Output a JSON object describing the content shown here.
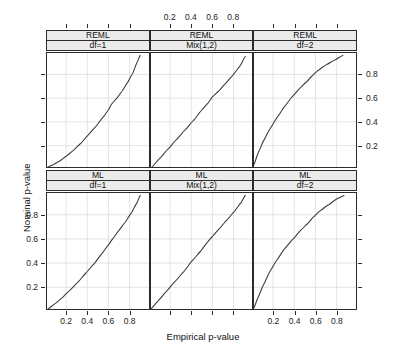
{
  "figure": {
    "type": "trellis-qq-grid",
    "xlabel": "Empirical p-value",
    "ylabel": "Nominal p-value",
    "axis_ticks": [
      "0.2",
      "0.4",
      "0.6",
      "0.8"
    ],
    "tick_values": [
      0.2,
      0.4,
      0.6,
      0.8
    ],
    "xlim": [
      0.02,
      0.98
    ],
    "ylim": [
      0.02,
      0.98
    ],
    "rows": [
      "REML",
      "ML"
    ],
    "columns": [
      "df=1",
      "Mix(1,2)",
      "df=2"
    ],
    "strip_bg": "#ebebeb",
    "curve_color": "#3a3a3a",
    "grid_color": "#d9d9d9"
  },
  "chart_data": {
    "type": "line",
    "title": "",
    "xlabel": "Empirical p-value",
    "ylabel": "Nominal p-value",
    "xlim": [
      0.02,
      0.98
    ],
    "ylim": [
      0.02,
      0.98
    ],
    "xticks": [
      0.2,
      0.4,
      0.6,
      0.8
    ],
    "yticks": [
      0.2,
      0.4,
      0.6,
      0.8
    ],
    "grid": true,
    "legend": "none",
    "panels": [
      {
        "row_strip": "REML",
        "col_strip": "df=1",
        "row": 0,
        "col": 0,
        "x": [
          0.03,
          0.08,
          0.14,
          0.2,
          0.27,
          0.34,
          0.41,
          0.48,
          0.55,
          0.6,
          0.63,
          0.68,
          0.73,
          0.78,
          0.83,
          0.87,
          0.9
        ],
        "y": [
          0.02,
          0.04,
          0.07,
          0.11,
          0.16,
          0.22,
          0.29,
          0.36,
          0.44,
          0.5,
          0.55,
          0.6,
          0.66,
          0.73,
          0.81,
          0.9,
          0.96
        ]
      },
      {
        "row_strip": "REML",
        "col_strip": "Mix(1,2)",
        "row": 0,
        "col": 1,
        "x": [
          0.03,
          0.1,
          0.18,
          0.26,
          0.34,
          0.42,
          0.5,
          0.56,
          0.6,
          0.66,
          0.72,
          0.79,
          0.86,
          0.91
        ],
        "y": [
          0.02,
          0.09,
          0.17,
          0.25,
          0.33,
          0.41,
          0.5,
          0.56,
          0.61,
          0.66,
          0.72,
          0.79,
          0.87,
          0.95
        ]
      },
      {
        "row_strip": "REML",
        "col_strip": "df=2",
        "row": 0,
        "col": 2,
        "x": [
          0.02,
          0.06,
          0.11,
          0.17,
          0.24,
          0.31,
          0.38,
          0.45,
          0.52,
          0.56,
          0.62,
          0.7,
          0.78,
          0.86
        ],
        "y": [
          0.04,
          0.14,
          0.24,
          0.34,
          0.44,
          0.53,
          0.61,
          0.68,
          0.74,
          0.78,
          0.83,
          0.88,
          0.92,
          0.96
        ]
      },
      {
        "row_strip": "ML",
        "col_strip": "df=1",
        "row": 1,
        "col": 0,
        "x": [
          0.03,
          0.09,
          0.16,
          0.23,
          0.31,
          0.39,
          0.47,
          0.54,
          0.6,
          0.64,
          0.7,
          0.76,
          0.82,
          0.87,
          0.9
        ],
        "y": [
          0.02,
          0.06,
          0.11,
          0.17,
          0.24,
          0.32,
          0.4,
          0.48,
          0.55,
          0.6,
          0.67,
          0.74,
          0.82,
          0.9,
          0.96
        ]
      },
      {
        "row_strip": "ML",
        "col_strip": "Mix(1,2)",
        "row": 1,
        "col": 1,
        "x": [
          0.02,
          0.09,
          0.17,
          0.25,
          0.33,
          0.41,
          0.49,
          0.55,
          0.6,
          0.67,
          0.74,
          0.81,
          0.87,
          0.91
        ],
        "y": [
          0.02,
          0.09,
          0.17,
          0.25,
          0.33,
          0.42,
          0.5,
          0.57,
          0.62,
          0.69,
          0.76,
          0.83,
          0.9,
          0.96
        ]
      },
      {
        "row_strip": "ML",
        "col_strip": "df=2",
        "row": 1,
        "col": 2,
        "x": [
          0.02,
          0.06,
          0.11,
          0.17,
          0.24,
          0.31,
          0.39,
          0.46,
          0.53,
          0.58,
          0.64,
          0.72,
          0.8,
          0.87
        ],
        "y": [
          0.03,
          0.12,
          0.22,
          0.33,
          0.43,
          0.52,
          0.6,
          0.67,
          0.73,
          0.78,
          0.83,
          0.88,
          0.93,
          0.96
        ]
      }
    ]
  }
}
